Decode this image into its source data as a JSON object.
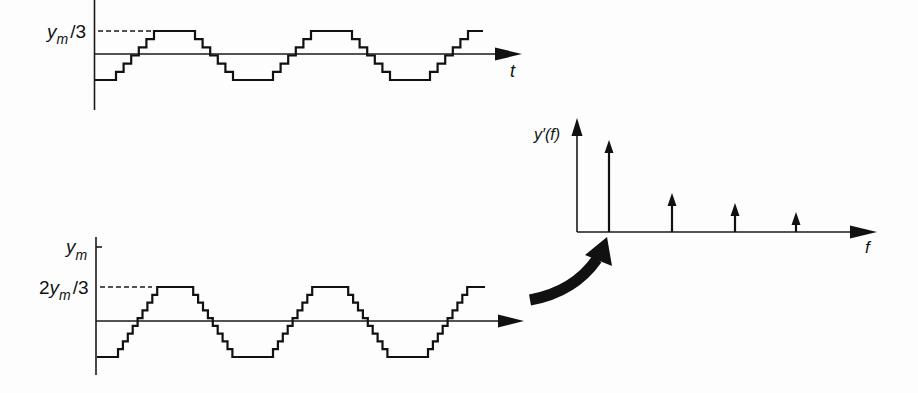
{
  "figure": {
    "top_waveform": {
      "level_label": {
        "base": "y",
        "sub": "m",
        "suffix": "/3"
      },
      "time_axis_label": "t",
      "geometry": {
        "x_start": 95,
        "x_end": 483,
        "first_rise": 116,
        "step_w": 7.6,
        "n_steps": 6,
        "top_flat": 41,
        "bottom_flat": 40,
        "y_low": 80,
        "y_high": 31
      }
    },
    "bottom_waveform": {
      "max_label": {
        "base": "y",
        "sub": "m"
      },
      "level_label": {
        "prefix": "2",
        "base": "y",
        "sub": "m",
        "suffix": "/3"
      },
      "geometry": {
        "x_start": 97,
        "x_end": 485,
        "first_rise": 118,
        "step_w": 4.9,
        "n_steps": 9,
        "top_flat": 36,
        "bottom_flat": 40.6,
        "y_low": 357,
        "y_high": 287
      }
    },
    "spectrum": {
      "y_label": "y′(f)",
      "x_label": "f",
      "origin": {
        "x": 577,
        "y": 232
      },
      "spikes": [
        {
          "harmonic": 1,
          "x": 609,
          "tip_y": 140
        },
        {
          "harmonic": 3,
          "x": 672,
          "tip_y": 193
        },
        {
          "harmonic": 5,
          "x": 735,
          "tip_y": 203
        },
        {
          "harmonic": 7,
          "x": 796,
          "tip_y": 212
        }
      ]
    }
  }
}
